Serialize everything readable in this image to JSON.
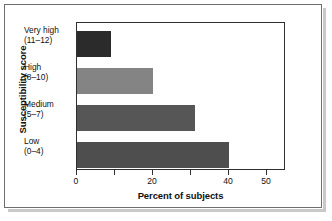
{
  "chart_data": {
    "type": "bar",
    "orientation": "horizontal",
    "title": "",
    "xlabel": "Percent of subjects",
    "ylabel": "Susceptibility score",
    "categories": [
      "Very high\n(11–12)",
      "High\n(8–10)",
      "Medium\n(5–7)",
      "Low\n(0–4)"
    ],
    "category_lines": [
      {
        "line1": "Very high",
        "line2": "(11–12)"
      },
      {
        "line1": "High",
        "line2": "(8–10)"
      },
      {
        "line1": "Medium",
        "line2": "(5–7)"
      },
      {
        "line1": "Low",
        "line2": "(0–4)"
      }
    ],
    "values": [
      9,
      20,
      31,
      40
    ],
    "bar_colors": [
      "#2b2b2b",
      "#848484",
      "#565656",
      "#4e4e4e"
    ],
    "xlim": [
      0,
      55
    ],
    "xticks": [
      0,
      10,
      20,
      30,
      40,
      50
    ],
    "xtick_labels": [
      "0",
      "",
      "20",
      "",
      "40",
      "50"
    ],
    "grid": false,
    "legend": null
  },
  "figure": {
    "frame_color": "#6e6e6e",
    "axis_color": "#2f2f2f",
    "background": "#ffffff"
  }
}
